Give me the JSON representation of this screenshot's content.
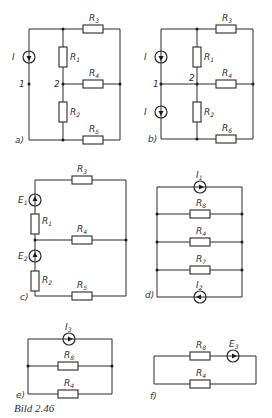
{
  "figure": {
    "caption": "Bild 2.46",
    "panels": [
      {
        "id": "a",
        "label": "a)",
        "components": {
          "I": {
            "symbol": "I",
            "sub": "",
            "type": "current-source"
          },
          "R3": {
            "symbol": "R",
            "sub": "3"
          },
          "R1": {
            "symbol": "R",
            "sub": "1"
          },
          "R4": {
            "symbol": "R",
            "sub": "4"
          },
          "R2": {
            "symbol": "R",
            "sub": "2"
          },
          "R5": {
            "symbol": "R",
            "sub": "5"
          }
        },
        "nodes": {
          "n1": "1",
          "n2": "2"
        }
      },
      {
        "id": "b",
        "label": "b)",
        "components": {
          "Ia": {
            "symbol": "I",
            "sub": "",
            "type": "current-source"
          },
          "Ib": {
            "symbol": "I",
            "sub": "",
            "type": "current-source"
          },
          "R3": {
            "symbol": "R",
            "sub": "3"
          },
          "R1": {
            "symbol": "R",
            "sub": "1"
          },
          "R4": {
            "symbol": "R",
            "sub": "4"
          },
          "R2": {
            "symbol": "R",
            "sub": "2"
          },
          "R6": {
            "symbol": "R",
            "sub": "6"
          }
        },
        "nodes": {
          "n1": "1",
          "n2": "2"
        }
      },
      {
        "id": "c",
        "label": "c)",
        "components": {
          "E1": {
            "symbol": "E",
            "sub": "1",
            "type": "voltage-source"
          },
          "E2": {
            "symbol": "E",
            "sub": "2",
            "type": "voltage-source"
          },
          "R1": {
            "symbol": "R",
            "sub": "1"
          },
          "R2": {
            "symbol": "R",
            "sub": "2"
          },
          "R3": {
            "symbol": "R",
            "sub": "3"
          },
          "R4": {
            "symbol": "R",
            "sub": "4"
          },
          "R5": {
            "symbol": "R",
            "sub": "5"
          }
        }
      },
      {
        "id": "d",
        "label": "d)",
        "components": {
          "I1": {
            "symbol": "I",
            "sub": "1",
            "type": "current-source"
          },
          "R8": {
            "symbol": "R",
            "sub": "8"
          },
          "R4": {
            "symbol": "R",
            "sub": "4"
          },
          "R7": {
            "symbol": "R",
            "sub": "7"
          },
          "I2": {
            "symbol": "I",
            "sub": "2",
            "type": "current-source"
          }
        }
      },
      {
        "id": "e",
        "label": "e)",
        "components": {
          "I3": {
            "symbol": "I",
            "sub": "3",
            "type": "current-source"
          },
          "R8": {
            "symbol": "R",
            "sub": "8"
          },
          "R4": {
            "symbol": "R",
            "sub": "4"
          }
        }
      },
      {
        "id": "f",
        "label": "f)",
        "components": {
          "R8": {
            "symbol": "R",
            "sub": "8"
          },
          "E3": {
            "symbol": "E",
            "sub": "3",
            "type": "voltage-source"
          },
          "R4": {
            "symbol": "R",
            "sub": "4"
          }
        }
      }
    ]
  }
}
